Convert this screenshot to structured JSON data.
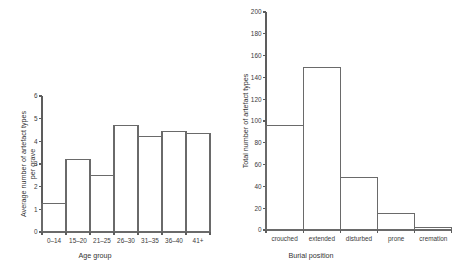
{
  "figure": {
    "background": "#ffffff",
    "axis_color": "#5d5d5d",
    "bar_edge_color": "#6a6a6a",
    "bar_fill_color": "#ffffff"
  },
  "chart_data": [
    {
      "type": "bar",
      "id": "age-group-chart",
      "title": "",
      "xlabel": "Age group",
      "ylabel": "Average number of artefact types per grave",
      "ylabel_line1": "Average number of artefact types",
      "ylabel_line2": "per grave",
      "categories": [
        "0–14",
        "15–20",
        "21–25",
        "26–30",
        "31–35",
        "36–40",
        "41+"
      ],
      "values": [
        1.25,
        3.2,
        2.5,
        4.7,
        4.2,
        4.45,
        4.35
      ],
      "ylim": [
        0,
        6
      ],
      "yticks": [
        0,
        1,
        2,
        3,
        4,
        5,
        6
      ],
      "ytick_labels": [
        "0",
        "1",
        "2",
        "3",
        "4",
        "5",
        "6"
      ],
      "grid": false,
      "legend": false
    },
    {
      "type": "bar",
      "id": "burial-position-chart",
      "title": "",
      "xlabel": "Burial position",
      "ylabel": "Total number of artefact types",
      "categories": [
        "crouched",
        "extended",
        "disturbed",
        "prone",
        "cremation"
      ],
      "values": [
        96,
        149,
        48,
        15,
        2
      ],
      "ylim": [
        0,
        200
      ],
      "yticks": [
        0,
        20,
        40,
        60,
        80,
        100,
        120,
        140,
        160,
        180,
        200
      ],
      "ytick_labels": [
        "0",
        "20",
        "40",
        "60",
        "80",
        "100",
        "120",
        "140",
        "160",
        "180",
        "200"
      ],
      "grid": false,
      "legend": false
    }
  ]
}
